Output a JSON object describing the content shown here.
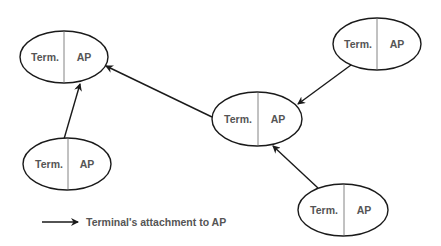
{
  "diagram": {
    "colors": {
      "stroke": "#1a1a1a",
      "divider": "#666666",
      "text": "#555555",
      "background": "#ffffff"
    },
    "nodes": [
      {
        "id": "node-top-left",
        "left_label": "Term.",
        "right_label": "AP",
        "cx": 64,
        "cy": 57,
        "rx": 44,
        "ry": 26
      },
      {
        "id": "node-top-right",
        "left_label": "Term.",
        "right_label": "AP",
        "cx": 377,
        "cy": 44,
        "rx": 44,
        "ry": 26
      },
      {
        "id": "node-center",
        "left_label": "Term.",
        "right_label": "AP",
        "cx": 257,
        "cy": 119,
        "rx": 45,
        "ry": 27
      },
      {
        "id": "node-bottom-left",
        "left_label": "Term.",
        "right_label": "AP",
        "cx": 67,
        "cy": 164,
        "rx": 44,
        "ry": 26
      },
      {
        "id": "node-bottom-right",
        "left_label": "Term.",
        "right_label": "AP",
        "cx": 343,
        "cy": 210,
        "rx": 45,
        "ry": 26
      }
    ],
    "edges": [
      {
        "from": "node-center",
        "to": "node-top-left"
      },
      {
        "from": "node-bottom-left",
        "to": "node-top-left"
      },
      {
        "from": "node-top-right",
        "to": "node-center"
      },
      {
        "from": "node-bottom-right",
        "to": "node-center"
      }
    ],
    "legend": {
      "label": "Terminal's attachment to AP"
    }
  }
}
